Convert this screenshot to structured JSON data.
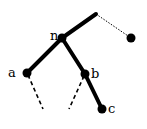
{
  "diagram": {
    "type": "tree",
    "nodes": [
      {
        "id": "root",
        "label": "",
        "x": 96,
        "y": 14,
        "drawn": false
      },
      {
        "id": "n",
        "label": "n",
        "x": 62,
        "y": 38
      },
      {
        "id": "r",
        "label": "",
        "x": 131,
        "y": 38
      },
      {
        "id": "a",
        "label": "a",
        "x": 27,
        "y": 73
      },
      {
        "id": "b",
        "label": "b",
        "x": 85,
        "y": 74
      },
      {
        "id": "c",
        "label": "c",
        "x": 102,
        "y": 109
      }
    ],
    "edges": [
      {
        "from": "root",
        "to": "n",
        "style": "thick"
      },
      {
        "from": "root",
        "to": "r",
        "style": "dotted"
      },
      {
        "from": "n",
        "to": "a",
        "style": "thick"
      },
      {
        "from": "n",
        "to": "b",
        "style": "thick"
      },
      {
        "from": "b",
        "to": "c",
        "style": "thick"
      },
      {
        "from": "a",
        "to": "a_child",
        "style": "dashed"
      },
      {
        "from": "b",
        "to": "b_child",
        "style": "dashed"
      }
    ],
    "labels": {
      "n": "n",
      "a": "a",
      "b": "b",
      "c": "c"
    },
    "colors": {
      "stroke": "#000000",
      "background": "#ffffff"
    }
  }
}
